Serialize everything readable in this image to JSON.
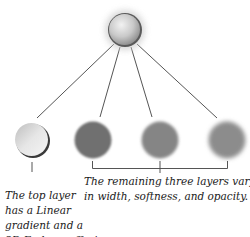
{
  "diagram": {
    "top_node": {
      "label": "combined-style",
      "cx": 125,
      "cy": 30,
      "r": 17
    },
    "children": [
      {
        "label": "top-layer-linear-gradient-emboss",
        "cx": 32,
        "cy": 140,
        "r": 17,
        "style": "gradient-emboss"
      },
      {
        "label": "layer-2",
        "cx": 93,
        "cy": 140,
        "r": 19,
        "style": "solid-dark"
      },
      {
        "label": "layer-3",
        "cx": 160,
        "cy": 140,
        "r": 19,
        "style": "soft-medium"
      },
      {
        "label": "layer-4",
        "cx": 227,
        "cy": 140,
        "r": 19,
        "style": "soft-light"
      }
    ],
    "colors": {
      "line": "#555555",
      "layer_dark": "#6f6f6f",
      "layer_soft": "#858585",
      "layer_soft2": "#8e8e8e"
    }
  },
  "captions": {
    "left": {
      "line1": "The top layer",
      "line2": "has a Linear",
      "line3": "gradient and a",
      "line4": "3D Emboss effect."
    },
    "right": {
      "line1": "The remaining three layers vary",
      "line2": "in width, softness, and opacity."
    }
  }
}
